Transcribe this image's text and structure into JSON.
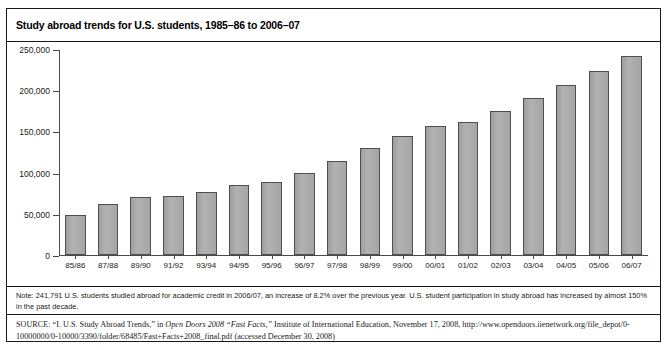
{
  "figure": {
    "title": "Study abroad trends for U.S. students, 1985–86 to 2006–07",
    "note": "Note: 241,791 U.S. students studied abroad for academic credit in 2006/07, an increase of 8.2% over the previous year. U.S. student participation in study abroad has increased by almost 150% in the past decade.",
    "source_keyword": "SOURCE:",
    "source_part1": " “I. U.S. Study Abroad Trends,” in ",
    "source_italic1": "Open Doors 2008 “Fast Facts,”",
    "source_part2": " Institute of International Education, November 17, 2008, http://www.opendoors.iienetwork.org/file_depot/0-10000000/0-10000/3390/folder/68485/Fast+Facts+2008_final.pdf (accessed December 30, 2008)"
  },
  "colors": {
    "bar_fill": "#a9a9a9",
    "bar_stroke": "#4f4f4f",
    "axis": "#4a4a4a",
    "border": "#1a1a1a"
  },
  "chart_data": {
    "type": "bar",
    "title": "Study abroad trends for U.S. students, 1985–86 to 2006–07",
    "xlabel": "",
    "ylabel": "",
    "ylim": [
      0,
      250000
    ],
    "grid": false,
    "legend": "none",
    "ytick_labels": [
      "250,000",
      "200,000",
      "150,000",
      "100,000",
      "50,000",
      "0"
    ],
    "ytick_values": [
      250000,
      200000,
      150000,
      100000,
      50000,
      0
    ],
    "categories": [
      "85/86",
      "87/88",
      "89/90",
      "91/92",
      "93/94",
      "94/95",
      "95/96",
      "96/97",
      "97/98",
      "98/99",
      "99/00",
      "00/01",
      "01/02",
      "02/03",
      "03/04",
      "04/05",
      "05/06",
      "06/07"
    ],
    "values": [
      48000,
      62000,
      71000,
      72000,
      76000,
      85000,
      89000,
      100000,
      114000,
      130000,
      144000,
      156000,
      162000,
      175000,
      191000,
      206000,
      223000,
      241000
    ]
  }
}
